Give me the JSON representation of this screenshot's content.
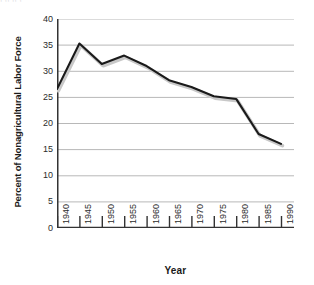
{
  "clipped_caption": ",  ,,                   ,,   ,",
  "chart_data": {
    "type": "line",
    "title": "",
    "xlabel": "Year",
    "ylabel": "Percent of Nonagricultural Labor Force",
    "x": [
      1940,
      1945,
      1950,
      1955,
      1960,
      1965,
      1970,
      1975,
      1980,
      1985,
      1990
    ],
    "values": [
      26.6,
      35.3,
      31.4,
      33.0,
      31.0,
      28.3,
      27.0,
      25.2,
      24.7,
      18.0,
      16.1
    ],
    "series": [
      {
        "name": "Union membership",
        "values": [
          26.6,
          35.3,
          31.4,
          33.0,
          31.0,
          28.3,
          27.0,
          25.2,
          24.7,
          18.0,
          16.1
        ]
      }
    ],
    "xlim": [
      1940,
      1990
    ],
    "ylim": [
      0,
      40
    ],
    "xticks": [
      1940,
      1945,
      1950,
      1955,
      1960,
      1965,
      1970,
      1975,
      1980,
      1985,
      1990
    ],
    "xtick_labels": [
      "1940",
      "1945",
      "1950",
      "1955",
      "1960",
      "1965",
      "1970",
      "1975",
      "1980",
      "1985",
      "1990"
    ],
    "yticks": [
      0,
      5,
      10,
      15,
      20,
      25,
      30,
      35,
      40
    ],
    "ytick_labels": [
      "0",
      "5",
      "10",
      "15",
      "20",
      "25",
      "30",
      "35",
      "40"
    ],
    "grid": "horizontal",
    "legend": "none",
    "line_color": "#1a1a1a",
    "shadow_color": "#c8c8c8",
    "grid_color": "#b8b8b8",
    "axis_color": "#333333",
    "background": "#ffffff"
  }
}
